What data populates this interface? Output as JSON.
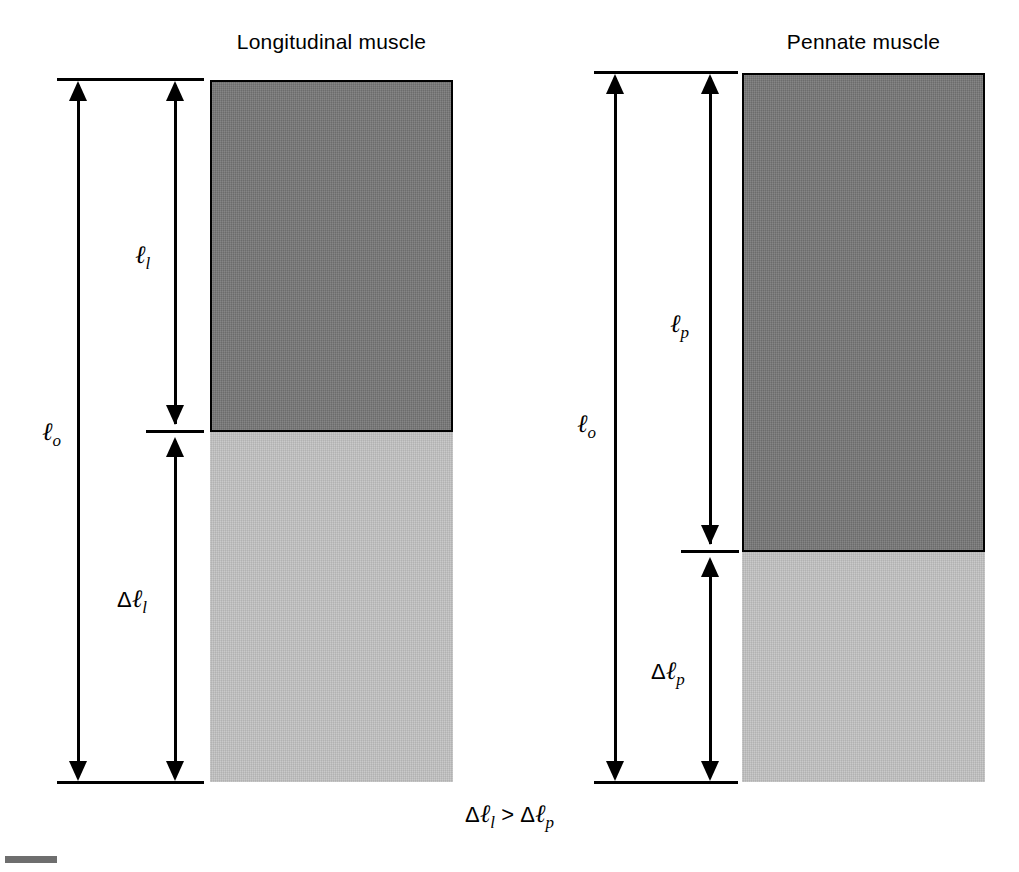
{
  "figure": {
    "relation": {
      "left_delta": "Δ",
      "left_symbol": "ℓ",
      "left_subscript": "l",
      "operator": ">",
      "right_delta": "Δ",
      "right_symbol": "ℓ",
      "right_subscript": "p",
      "full_text": "Δℓl > Δℓp"
    }
  },
  "panels": [
    {
      "id": "longitudinal",
      "title": "Longitudinal muscle",
      "bars": [
        {
          "name": "contracted-muscle-segment",
          "shade": "dark",
          "color": "#757575"
        },
        {
          "name": "shortening-excursion-segment",
          "shade": "light",
          "color": "#c2c2c2"
        }
      ],
      "measures": [
        {
          "name": "resting-length",
          "delta": "",
          "symbol": "ℓ",
          "subscript": "o",
          "label": "ℓo"
        },
        {
          "name": "fiber-length",
          "delta": "",
          "symbol": "ℓ",
          "subscript": "l",
          "label": "ℓl"
        },
        {
          "name": "length-change",
          "delta": "Δ",
          "symbol": "ℓ",
          "subscript": "l",
          "label": "Δℓl"
        }
      ]
    },
    {
      "id": "pennate",
      "title": "Pennate muscle",
      "bars": [
        {
          "name": "contracted-muscle-segment",
          "shade": "dark",
          "color": "#757575"
        },
        {
          "name": "shortening-excursion-segment",
          "shade": "light",
          "color": "#c2c2c2"
        }
      ],
      "measures": [
        {
          "name": "resting-length",
          "delta": "",
          "symbol": "ℓ",
          "subscript": "o",
          "label": "ℓo"
        },
        {
          "name": "fiber-length",
          "delta": "",
          "symbol": "ℓ",
          "subscript": "p",
          "label": "ℓp"
        },
        {
          "name": "length-change",
          "delta": "Δ",
          "symbol": "ℓ",
          "subscript": "p",
          "label": "Δℓp"
        }
      ]
    }
  ]
}
